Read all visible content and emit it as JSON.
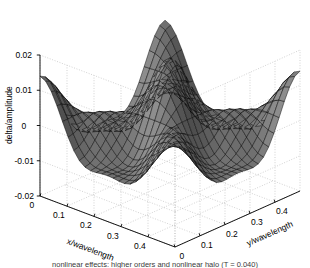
{
  "figure": {
    "kind": "matlab-3d-mesh-surface",
    "background": "#ffffff",
    "line_color": "#000000",
    "grid_color": "#b4b4b4",
    "axis_color": "#000000"
  },
  "axes": {
    "z": {
      "label": "delta/amplitude",
      "ticks": [
        "0.02",
        "0.01",
        "0",
        "-0.01",
        "-0.02"
      ],
      "tick_values": [
        0.02,
        0.01,
        0,
        -0.01,
        -0.02
      ],
      "range": [
        -0.02,
        0.02
      ]
    },
    "x": {
      "label": "x/wavelength",
      "ticks": [
        "0",
        "0.1",
        "0.2",
        "0.3",
        "0.4"
      ],
      "tick_values": [
        0,
        0.1,
        0.2,
        0.3,
        0.4
      ],
      "range": [
        0,
        0.5
      ]
    },
    "y": {
      "label": "y/wavelength",
      "ticks": [
        "0",
        "0.1",
        "0.2",
        "0.3",
        "0.4"
      ],
      "tick_values": [
        0,
        0.1,
        0.2,
        0.3,
        0.4
      ],
      "range": [
        0,
        0.5
      ]
    }
  },
  "caption": "nonlinear effects: higher orders and nonlinear halo (T = 0.040)",
  "chart_data": {
    "type": "surface",
    "title": "",
    "xlabel": "x/wavelength",
    "ylabel": "y/wavelength",
    "zlabel": "delta/amplitude",
    "xlim": [
      0,
      0.5
    ],
    "ylim": [
      0,
      0.5
    ],
    "zlim": [
      -0.02,
      0.02
    ],
    "grid": true,
    "legend": "none",
    "colormap": "gray",
    "mesh_n": 24,
    "surface_model": {
      "description": "saddle-like bowl: high corners and a raised central peak toward the back, deep annular valley between, with a small secondary bump in the basin",
      "formula": "z = A*cos(2*pi*u)*cos(2*pi*v) + B*cos(4*pi*u)*cos(4*pi*v) + C*exp(-((u-0.5)^2+(v-0.5)^2)/s)",
      "A": 0.0105,
      "B": 0.0035,
      "C": 0.0045,
      "s": 0.012
    },
    "notable_points": [
      {
        "label": "central peak",
        "x": 0.25,
        "y": 0.25,
        "z": 0.024
      },
      {
        "label": "left corner ridge",
        "x": 0.0,
        "y": 0.0,
        "z": 0.011
      },
      {
        "label": "right corner ridge",
        "x": 0.5,
        "y": 0.5,
        "z": 0.011
      },
      {
        "label": "annular valley",
        "x": 0.25,
        "y": 0.0,
        "z": -0.0105
      },
      {
        "label": "basin bump",
        "x": 0.25,
        "y": 0.25,
        "z": -0.0045
      }
    ]
  }
}
